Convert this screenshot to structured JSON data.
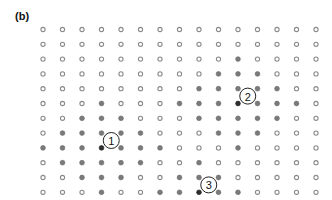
{
  "panel_label": "(b)",
  "grid": {
    "columns": 15,
    "rows": 12,
    "origin_x": 43,
    "origin_y": 29.5,
    "dx": 19.5,
    "dy": 14.8,
    "legend_states": {
      "0": "open",
      "1": "filled",
      "2": "dark-filled"
    },
    "cells": [
      [
        0,
        0,
        0,
        0,
        0,
        0,
        0,
        0,
        0,
        0,
        0,
        0,
        0,
        0,
        0
      ],
      [
        0,
        0,
        0,
        0,
        0,
        0,
        0,
        0,
        0,
        0,
        0,
        0,
        0,
        0,
        0
      ],
      [
        0,
        0,
        0,
        0,
        0,
        0,
        0,
        0,
        0,
        0,
        1,
        0,
        0,
        0,
        0
      ],
      [
        0,
        0,
        0,
        0,
        0,
        0,
        0,
        0,
        0,
        1,
        1,
        1,
        0,
        0,
        0
      ],
      [
        0,
        0,
        0,
        0,
        0,
        0,
        0,
        0,
        1,
        1,
        1,
        1,
        1,
        0,
        0
      ],
      [
        0,
        0,
        0,
        1,
        0,
        0,
        0,
        1,
        1,
        1,
        2,
        1,
        1,
        1,
        0
      ],
      [
        0,
        0,
        1,
        1,
        1,
        0,
        0,
        0,
        1,
        1,
        1,
        1,
        1,
        0,
        0
      ],
      [
        0,
        1,
        1,
        1,
        1,
        1,
        0,
        0,
        0,
        1,
        1,
        1,
        0,
        0,
        0
      ],
      [
        1,
        1,
        1,
        2,
        1,
        1,
        1,
        0,
        0,
        0,
        1,
        0,
        0,
        0,
        0
      ],
      [
        0,
        1,
        1,
        1,
        1,
        1,
        0,
        0,
        1,
        0,
        0,
        0,
        0,
        0,
        0
      ],
      [
        0,
        0,
        1,
        1,
        1,
        0,
        0,
        1,
        1,
        1,
        0,
        0,
        0,
        0,
        0
      ],
      [
        0,
        0,
        0,
        1,
        0,
        0,
        1,
        1,
        2,
        1,
        1,
        0,
        0,
        0,
        0
      ]
    ]
  },
  "markers": [
    {
      "label": "1",
      "between_cols": [
        4,
        5
      ],
      "between_rows": [
        8,
        9
      ]
    },
    {
      "label": "2",
      "between_cols": [
        11,
        12
      ],
      "between_rows": [
        5,
        6
      ]
    },
    {
      "label": "3",
      "between_cols": [
        9,
        10
      ],
      "between_rows": [
        11,
        12
      ]
    }
  ],
  "colors": {
    "ring_stroke": "#8a8a8a",
    "filled": "#7a7a7a",
    "dark": "#2e2e2e",
    "marker_stroke": "#222222"
  }
}
